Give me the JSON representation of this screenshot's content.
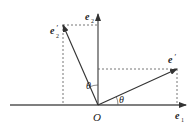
{
  "diagram": {
    "type": "vector-rotation",
    "colors": {
      "axis": "#555555",
      "vector": "#333333",
      "dashed": "#666666",
      "text": "#222222"
    },
    "labels": {
      "origin": "O",
      "e1_base": "e",
      "e1_sub": "1",
      "e2_base": "e",
      "e2_sub": "2",
      "e1p_base": "e",
      "e1p_prime": "′",
      "e1p_sub": "1",
      "e2p_base": "e",
      "e2p_prime": "′",
      "e2p_sub": "2",
      "theta_upper": "θ",
      "theta_lower": "θ"
    }
  }
}
